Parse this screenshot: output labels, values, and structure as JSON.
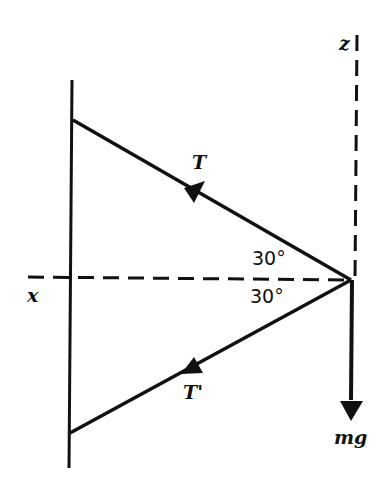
{
  "diagram": {
    "type": "free-body force diagram",
    "labels": {
      "z_axis": "z",
      "x_axis": "x",
      "tension_upper": "T",
      "tension_lower": "T'",
      "weight": "mg",
      "angle_upper": "30°",
      "angle_lower": "30°"
    },
    "colors": {
      "line": "#111111",
      "background": "#ffffff"
    }
  }
}
